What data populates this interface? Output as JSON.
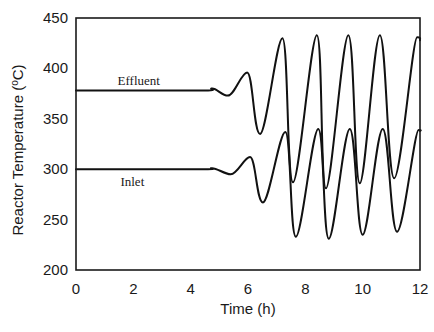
{
  "chart_data": {
    "type": "line",
    "title": "",
    "xlabel": "Time (h)",
    "ylabel": "Reactor Temperature (°C)",
    "ylabel_parts": {
      "main": "Reactor Temperature (",
      "sup": "o",
      "unit": "C)"
    },
    "xlim": [
      0,
      12
    ],
    "ylim": [
      200,
      450
    ],
    "x_ticks": [
      0,
      2,
      4,
      6,
      8,
      10,
      12
    ],
    "y_ticks": [
      200,
      250,
      300,
      350,
      400,
      450
    ],
    "grid": false,
    "legend": "none (inline curve labels)",
    "series": [
      {
        "name": "Effluent",
        "label_pos": {
          "t": 1.45,
          "T": 384
        },
        "points": [
          [
            0,
            378
          ],
          [
            4.3,
            378
          ],
          [
            4.75,
            380
          ],
          [
            5.3,
            373
          ],
          [
            5.97,
            396
          ],
          [
            6.42,
            335
          ],
          [
            7.2,
            430
          ],
          [
            7.57,
            287
          ],
          [
            8.4,
            433
          ],
          [
            8.72,
            281
          ],
          [
            9.5,
            433
          ],
          [
            9.9,
            286
          ],
          [
            10.6,
            433
          ],
          [
            11.1,
            291
          ],
          [
            11.9,
            431
          ],
          [
            12,
            428
          ]
        ]
      },
      {
        "name": "Inlet",
        "label_pos": {
          "t": 1.55,
          "T": 283
        },
        "points": [
          [
            0,
            300
          ],
          [
            4.3,
            300
          ],
          [
            4.75,
            301
          ],
          [
            5.4,
            295
          ],
          [
            6.07,
            312
          ],
          [
            6.52,
            267
          ],
          [
            7.3,
            337
          ],
          [
            7.67,
            233
          ],
          [
            8.45,
            340
          ],
          [
            8.82,
            231
          ],
          [
            9.55,
            340
          ],
          [
            10.0,
            235
          ],
          [
            10.7,
            340
          ],
          [
            11.2,
            238
          ],
          [
            11.95,
            339
          ],
          [
            12,
            338
          ]
        ]
      }
    ]
  },
  "layout": {
    "plot_left": 76,
    "plot_right": 420,
    "plot_top": 18,
    "plot_bottom": 270
  }
}
